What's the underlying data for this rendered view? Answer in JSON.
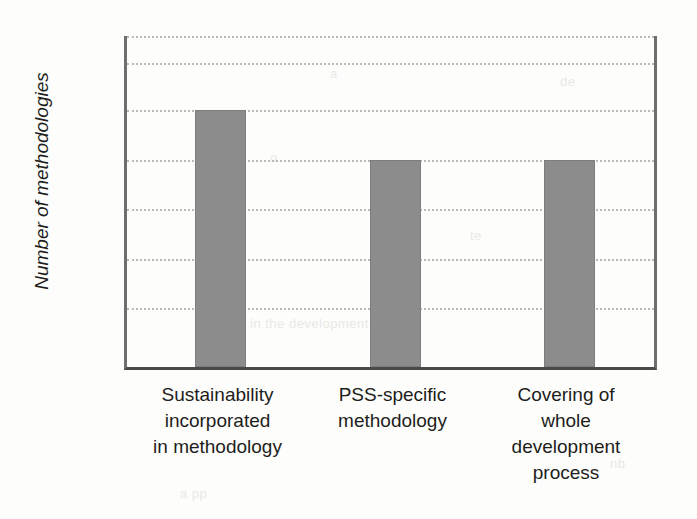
{
  "chart_data": {
    "type": "bar",
    "title": "",
    "xlabel": "",
    "ylabel": "Number of methodologies",
    "categories": [
      "Sustainability incorporated in methodology",
      "PSS-specific methodology",
      "Covering of whole development process"
    ],
    "category_lines": [
      [
        "Sustainability",
        "incorporated",
        "in methodology"
      ],
      [
        "PSS-specific",
        "methodology"
      ],
      [
        "Covering of",
        "whole",
        "development",
        "process"
      ]
    ],
    "values": [
      10,
      8,
      8
    ],
    "ylim": [
      0,
      13
    ],
    "ytick_labels": [
      "13",
      "10",
      "6",
      "2"
    ],
    "ytick_values": [
      13,
      10,
      6,
      2
    ],
    "gridline_values": [
      13,
      11.9,
      10,
      8,
      6,
      4,
      2
    ],
    "grid": true,
    "legend": "none",
    "bar_color": "#8c8c8c",
    "bar_edge_color": "#7d7d7d",
    "gridline_color": "#b9b9b7",
    "axis_color": "#6e6e6e",
    "text_color": "#1d1d1b",
    "background_color": "#fdfdfc"
  },
  "artifacts": [
    {
      "text": "a",
      "left": 330,
      "top": 66
    },
    {
      "text": "de",
      "left": 560,
      "top": 74
    },
    {
      "text": "o",
      "left": 270,
      "top": 150
    },
    {
      "text": "te",
      "left": 470,
      "top": 228
    },
    {
      "text": "la",
      "left": 220,
      "top": 288
    },
    {
      "text": "in the development process",
      "left": 250,
      "top": 316
    },
    {
      "text": "nb",
      "left": 610,
      "top": 456
    },
    {
      "text": "a pp",
      "left": 180,
      "top": 486
    }
  ]
}
